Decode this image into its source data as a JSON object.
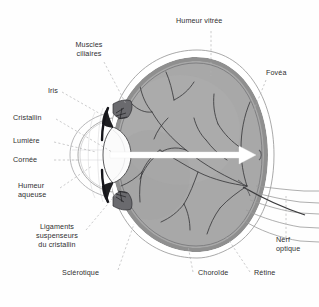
{
  "diagram": {
    "language": "fr",
    "background_color": "#fefefe",
    "text_color": "#2e2e30",
    "vitreous_color": "#a8a8a8",
    "choroid_color": "#8f8f8f",
    "sclera_outline_color": "#9a9a9a",
    "vessel_color": "#3a3a3c",
    "lens_color": "#fbfbfb",
    "iris_color": "#1f1f22",
    "light_ray_color": "#ffffff",
    "leader_color": "#b0b0b2"
  },
  "labels": {
    "humeur_vitree": "Humeur vitrée",
    "fovea": "Fovéa",
    "muscles_ciliaires_1": "Muscles",
    "muscles_ciliaires_2": "ciliaires",
    "iris": "Iris",
    "cristallin": "Cristallin",
    "lumiere": "Lumière",
    "cornee": "Cornée",
    "humeur_aqueuse_1": "Humeur",
    "humeur_aqueuse_2": "aqueuse",
    "ligaments_1": "Ligaments",
    "ligaments_2": "suspenseurs",
    "ligaments_3": "du cristallin",
    "sclerotique": "Sclérotique",
    "choroide": "Choroïde",
    "retine": "Rétine",
    "nerf_optique_1": "Nerf",
    "nerf_optique_2": "optique"
  },
  "structures": [
    {
      "name": "humeur-vitree",
      "label": "Humeur vitrée",
      "region": "interior-center"
    },
    {
      "name": "fovea",
      "label": "Fovéa",
      "region": "posterior-retina"
    },
    {
      "name": "muscles-ciliaires",
      "label": "Muscles ciliaires",
      "region": "anterior-superior"
    },
    {
      "name": "iris",
      "label": "Iris",
      "region": "anterior"
    },
    {
      "name": "cristallin",
      "label": "Cristallin",
      "region": "anterior-center"
    },
    {
      "name": "lumiere",
      "label": "Lumière",
      "region": "optical-axis"
    },
    {
      "name": "cornee",
      "label": "Cornée",
      "region": "anterior-outer"
    },
    {
      "name": "humeur-aqueuse",
      "label": "Humeur aqueuse",
      "region": "anterior-chamber"
    },
    {
      "name": "ligaments-suspenseurs-du-cristallin",
      "label": "Ligaments suspenseurs du cristallin",
      "region": "anterior-inferior"
    },
    {
      "name": "sclerotique",
      "label": "Sclérotique",
      "region": "outer-coat"
    },
    {
      "name": "choroide",
      "label": "Choroïde",
      "region": "middle-coat"
    },
    {
      "name": "retine",
      "label": "Rétine",
      "region": "inner-coat"
    },
    {
      "name": "nerf-optique",
      "label": "Nerf optique",
      "region": "posterior-exit"
    }
  ]
}
